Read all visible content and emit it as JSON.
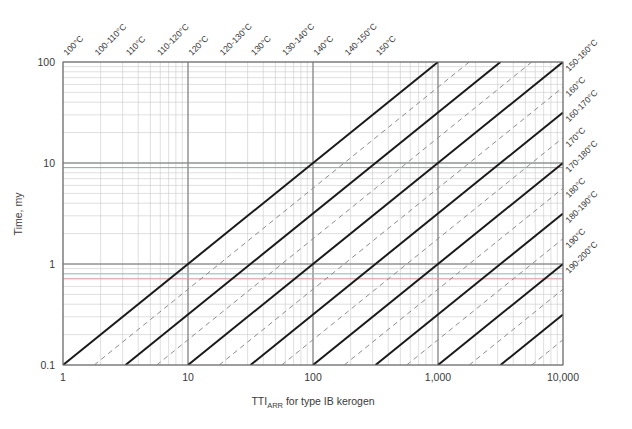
{
  "chart_data": {
    "type": "line",
    "title": "",
    "xlabel": "TTI_ARR for type IB kerogen",
    "xlabel_main": "TTI",
    "xlabel_sub": "ARR",
    "xlabel_rest": " for type IB kerogen",
    "ylabel": "Time, my",
    "xscale": "log",
    "yscale": "log",
    "xlim": [
      1,
      10000
    ],
    "ylim": [
      0.1,
      100
    ],
    "grid": true,
    "grid_minor": true,
    "legend_position": "none",
    "xticks": [
      1,
      10,
      100,
      1000,
      10000
    ],
    "xticklabels": [
      "1",
      "10",
      "100",
      "1,000",
      "10,000"
    ],
    "yticks": [
      0.1,
      1,
      10,
      100
    ],
    "yticklabels": [
      "0.1",
      "1",
      "10",
      "100"
    ],
    "series_description": "Family of parallel iso-temperature lines of slope 1 on log-log axes; solid lines are single-temperature contours, dashed lines are temperature-range contours, alternating every half decade of TTI.",
    "solid_lines": [
      {
        "label": "100°C",
        "x_at_ymin": 1.0,
        "y_at_x1": 20.0,
        "style": "solid"
      },
      {
        "label": "110°C",
        "x_at_ymin": 3.1623,
        "y_at_x1": 6.3,
        "style": "solid"
      },
      {
        "label": "120°C",
        "x_at_ymin": 10.0,
        "y_at_x1": 2.0,
        "style": "solid"
      },
      {
        "label": "130°C",
        "x_at_ymin": 31.623,
        "y_at_x1": 0.63,
        "style": "solid"
      },
      {
        "label": "140°C",
        "x_at_ymin": 100.0,
        "y_at_x1": 0.2,
        "style": "solid"
      },
      {
        "label": "150°C",
        "x_at_ymin": 316.23,
        "y_at_x1": 0.063,
        "style": "solid"
      },
      {
        "label": "160°C",
        "x_at_ymin": 1000.0,
        "y_at_x1": 0.02,
        "style": "solid"
      },
      {
        "label": "170°C",
        "x_at_ymin": 3162.3,
        "y_at_x1": 0.0063,
        "style": "solid"
      },
      {
        "label": "180°C",
        "x_at_ymin": 10000.0,
        "y_at_x1": 0.002,
        "style": "solid"
      },
      {
        "label": "190°C",
        "x_at_ymin": 31623.0,
        "y_at_x1": 0.00063,
        "style": "solid"
      }
    ],
    "dashed_lines": [
      {
        "label": "100-110°C",
        "x_at_ymin": 1.778,
        "style": "dashed"
      },
      {
        "label": "110-120°C",
        "x_at_ymin": 5.623,
        "style": "dashed"
      },
      {
        "label": "120-130°C",
        "x_at_ymin": 17.78,
        "style": "dashed"
      },
      {
        "label": "130-140°C",
        "x_at_ymin": 56.23,
        "style": "dashed"
      },
      {
        "label": "140-150°C",
        "x_at_ymin": 177.8,
        "style": "dashed"
      },
      {
        "label": "150-160°C",
        "x_at_ymin": 562.3,
        "style": "dashed"
      },
      {
        "label": "160-170°C",
        "x_at_ymin": 1778.0,
        "style": "dashed"
      },
      {
        "label": "170-180°C",
        "x_at_ymin": 5623.0,
        "style": "dashed"
      },
      {
        "label": "180-190°C",
        "x_at_ymin": 17780.0,
        "style": "dashed"
      },
      {
        "label": "190-200°C",
        "x_at_ymin": 56230.0,
        "style": "dashed"
      }
    ],
    "top_labels": [
      "100°C",
      "100-110°C",
      "110°C",
      "110-120°C",
      "120°C",
      "120-130°C",
      "130°C",
      "130-140°C",
      "140°C",
      "140-150°C",
      "150°C"
    ],
    "right_labels": [
      "150-160°C",
      "160°C",
      "160-170°C",
      "170°C",
      "170-180°C",
      "180°C",
      "180-190°C",
      "190°C",
      "190-200°C"
    ],
    "highlight_lines": [
      {
        "y": 9.0,
        "color": "#6fae9a",
        "note": "faint teal horizontal marker"
      },
      {
        "y": 0.8,
        "color": "#7fc3c0",
        "note": "faint teal horizontal marker"
      },
      {
        "y": 0.72,
        "color": "#d9a3ad",
        "note": "faint pink horizontal marker"
      }
    ],
    "colors": {
      "solid_line": "#1a1a1a",
      "dashed_line": "#8c8c8c",
      "grid_major": "#8a8a8a",
      "grid_minor": "#c9c9c9",
      "frame": "#707070",
      "text": "#333333",
      "background": "#ffffff"
    }
  },
  "axes": {
    "x_title_main": "TTI",
    "x_title_sub": "ARR",
    "x_title_rest": " for type IB kerogen",
    "y_title": "Time, my"
  }
}
